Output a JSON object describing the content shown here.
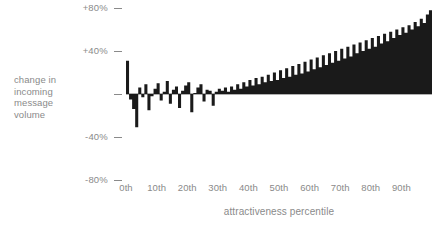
{
  "chart_data": {
    "type": "area",
    "title": "",
    "subtitle": "",
    "xlabel": "attractiveness percentile",
    "ylabel": "change in incoming message volume",
    "ylabel_lines": [
      "change in",
      "incoming",
      "message",
      "volume"
    ],
    "xlim": [
      0,
      100
    ],
    "ylim": [
      -80,
      80
    ],
    "grid": false,
    "legend": false,
    "legend_position": "none",
    "series_color": "#1a1a1a",
    "axis_text_color": "#8a8a8a",
    "background_color": "#ffffff",
    "ytick_labels": [
      "+80%",
      "+40%",
      "",
      "-40%",
      "-80%"
    ],
    "ytick_values": [
      80,
      40,
      0,
      -40,
      -80
    ],
    "xtick_labels": [
      "0th",
      "10th",
      "20th",
      "30th",
      "40th",
      "50th",
      "60th",
      "70th",
      "80th",
      "90th"
    ],
    "xtick_values": [
      0,
      10,
      20,
      30,
      40,
      50,
      60,
      70,
      80,
      90
    ],
    "x": [
      0,
      1,
      2,
      3,
      4,
      5,
      6,
      7,
      8,
      9,
      10,
      11,
      12,
      13,
      14,
      15,
      16,
      17,
      18,
      19,
      20,
      21,
      22,
      23,
      24,
      25,
      26,
      27,
      28,
      29,
      30,
      31,
      32,
      33,
      34,
      35,
      36,
      37,
      38,
      39,
      40,
      41,
      42,
      43,
      44,
      45,
      46,
      47,
      48,
      49,
      50,
      51,
      52,
      53,
      54,
      55,
      56,
      57,
      58,
      59,
      60,
      61,
      62,
      63,
      64,
      65,
      66,
      67,
      68,
      69,
      70,
      71,
      72,
      73,
      74,
      75,
      76,
      77,
      78,
      79,
      80,
      81,
      82,
      83,
      84,
      85,
      86,
      87,
      88,
      89,
      90,
      91,
      92,
      93,
      94,
      95,
      96,
      97,
      98,
      99
    ],
    "values": [
      31,
      -5,
      -14,
      -31,
      6,
      -3,
      9,
      -15,
      -2,
      5,
      10,
      -6,
      2,
      12,
      -9,
      4,
      7,
      -13,
      3,
      8,
      11,
      -17,
      1,
      6,
      9,
      -7,
      4,
      3,
      -11,
      2,
      5,
      3,
      6,
      2,
      7,
      4,
      9,
      5,
      11,
      7,
      13,
      8,
      15,
      9,
      16,
      11,
      18,
      12,
      20,
      13,
      22,
      15,
      24,
      16,
      26,
      18,
      28,
      19,
      30,
      21,
      32,
      23,
      34,
      25,
      36,
      27,
      38,
      29,
      40,
      31,
      42,
      33,
      44,
      35,
      46,
      38,
      48,
      40,
      50,
      42,
      52,
      44,
      54,
      47,
      56,
      49,
      58,
      52,
      60,
      55,
      62,
      57,
      64,
      60,
      67,
      63,
      70,
      66,
      74,
      78
    ]
  }
}
